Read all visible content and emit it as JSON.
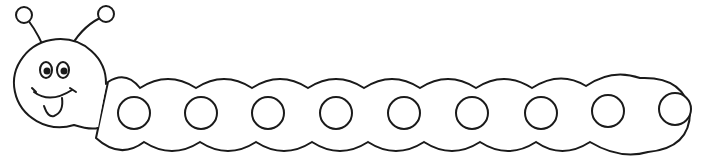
{
  "image": {
    "subject": "caterpillar coloring page",
    "body_segments": 9,
    "colors": {
      "stroke": "#1a1a1a",
      "fill": "#ffffff"
    }
  },
  "segments": [
    {
      "cx": 134
    },
    {
      "cx": 201
    },
    {
      "cx": 268
    },
    {
      "cx": 336
    },
    {
      "cx": 404
    },
    {
      "cx": 472
    },
    {
      "cx": 541
    },
    {
      "cx": 608
    },
    {
      "cx": 675
    }
  ]
}
